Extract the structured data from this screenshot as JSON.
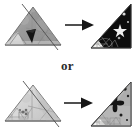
{
  "figure": {
    "background_color": "#ffffff",
    "connector_label": "or",
    "width": 135,
    "height": 134
  },
  "palette": {
    "paper_gray_dark": "#8f8f8f",
    "paper_gray_mid": "#a8a8a8",
    "paper_gray_light": "#cfcfcf",
    "paper_white": "#f4f4f2",
    "ink_black": "#111111",
    "outline": "#3a3a3a",
    "fold_line": "#555555",
    "star_white": "#f2f2f2",
    "text_color": "#2b2b2b"
  },
  "rows": [
    {
      "id": "option-a",
      "label": "First folding option",
      "before": {
        "name": "folded-paper-triangle-gray",
        "shape": "isoceles-triangle",
        "fill": "#9a9a9a",
        "description": "Gray patterned triangular paper with diagonal fold line and dark folded flap",
        "fold_line": true,
        "flap_color": "#1a1a1a"
      },
      "arrow": {
        "name": "right-arrow",
        "direction": "right",
        "color": "#161616"
      },
      "after": {
        "name": "result-triangle-black-star",
        "shape": "right-triangle",
        "orientation": "right-angle-bottom-right",
        "upper_fill": "#0d0d0d",
        "lower_fill": "#f4f4f2",
        "motif": "star",
        "motif_color": "#ededed",
        "description": "Right triangle, black upper field with white star, pale lower-left field with line pattern"
      }
    },
    {
      "id": "option-b",
      "label": "Second folding option",
      "before": {
        "name": "folded-paper-triangle-light",
        "shape": "isoceles-triangle",
        "fill": "#d2d2d2",
        "description": "Pale gray triangular paper with diagonal fold line and small inner motif",
        "fold_line": true,
        "flap_color": "#6e6e6e"
      },
      "arrow": {
        "name": "right-arrow",
        "direction": "right",
        "color": "#161616"
      },
      "after": {
        "name": "result-triangle-gray-flower",
        "shape": "right-triangle",
        "orientation": "right-angle-bottom-right",
        "upper_fill": "#b6b6b6",
        "lower_fill": "#f2f2f0",
        "motif": "flower",
        "motif_color": "#141414",
        "description": "Right triangle, gray upper field with dark flower motif, pale lower-left field with line pattern"
      }
    }
  ]
}
